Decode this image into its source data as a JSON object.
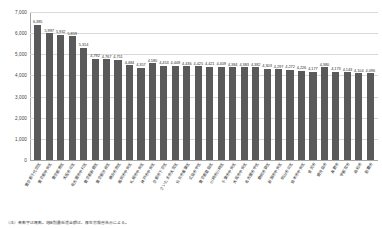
{
  "chart_data": {
    "type": "bar",
    "title": "",
    "xlabel": "",
    "ylabel": "",
    "ylim": [
      0,
      7000
    ],
    "ytick_labels": [
      "7,000",
      "6,000",
      "5,000",
      "4,000",
      "3,000",
      "2,000",
      "1,000",
      "0"
    ],
    "ytick_values": [
      7000,
      6000,
      5000,
      4000,
      3000,
      2000,
      1000,
      0
    ],
    "grid": true,
    "legend": false,
    "bar_color": "#5a5a5a",
    "categories": [
      "東京都千代田区",
      "東京都中央区",
      "東京都港区",
      "大阪市北区",
      "名古屋市中村区",
      "東京都新宿区",
      "東京都渋谷区",
      "横浜市西区",
      "福岡市中央区",
      "札幌市中央区",
      "神戸市中央区",
      "京都市下京区",
      "さいたま市大宮区",
      "仙台市青葉区",
      "広島市中区",
      "東京都豊島区",
      "川崎市川崎区",
      "千葉市中央区",
      "大阪市中央区",
      "名古屋市中区",
      "静岡市葵区",
      "新潟市中央区",
      "岡山市北区",
      "熊本市中央区",
      "金沢市",
      "鹿児島市",
      "長野市",
      "宇都宮市",
      "高松市",
      "那覇市"
    ],
    "values": [
      6385,
      5997,
      5932,
      5859,
      5314,
      4792,
      4767,
      4751,
      4484,
      4357,
      4580,
      4453,
      4448,
      4436,
      4425,
      4421,
      4409,
      4384,
      4383,
      4382,
      4303,
      4297,
      4272,
      4226,
      4177,
      4380,
      4173,
      4143,
      4104,
      4096
    ],
    "value_labels": [
      "6,385",
      "5,997",
      "5,932",
      "5,859",
      "5,314",
      "4,792",
      "4,767",
      "4,751",
      "4,484",
      "4,357",
      "4,580",
      "4,453",
      "4,448",
      "4,436",
      "4,425",
      "4,421",
      "4,409",
      "4,384",
      "4,383",
      "4,382",
      "4,303",
      "4,297",
      "4,272",
      "4,226",
      "4,177",
      "4,380",
      "4,173",
      "4,143",
      "4,104",
      "4,096"
    ]
  },
  "footer": {
    "source_note": "（注）各数字は概数。地域別最低賃金額は、厚生労働省告示による。"
  }
}
